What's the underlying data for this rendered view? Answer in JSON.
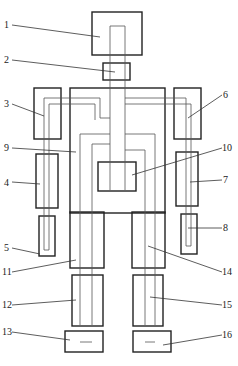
{
  "diagram": {
    "type": "robot-skeleton-schematic",
    "labels": [
      {
        "id": "1",
        "text": "1"
      },
      {
        "id": "2",
        "text": "2"
      },
      {
        "id": "3",
        "text": "3"
      },
      {
        "id": "4",
        "text": "4"
      },
      {
        "id": "5",
        "text": "5"
      },
      {
        "id": "6",
        "text": "6"
      },
      {
        "id": "7",
        "text": "7"
      },
      {
        "id": "8",
        "text": "8"
      },
      {
        "id": "9",
        "text": "9"
      },
      {
        "id": "10",
        "text": "10"
      },
      {
        "id": "11",
        "text": "11"
      },
      {
        "id": "12",
        "text": "12"
      },
      {
        "id": "13",
        "text": "13"
      },
      {
        "id": "14",
        "text": "14"
      },
      {
        "id": "15",
        "text": "15"
      },
      {
        "id": "16",
        "text": "16"
      }
    ],
    "colors": {
      "stroke": "#222222",
      "wire": "#555555",
      "background": "#ffffff"
    }
  }
}
